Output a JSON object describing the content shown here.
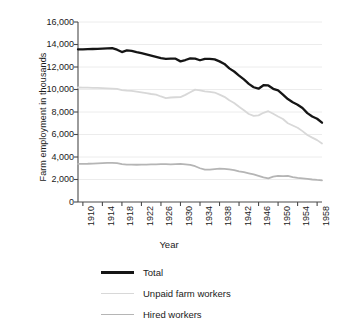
{
  "chart_data": {
    "type": "line",
    "title": "",
    "xlabel": "Year",
    "ylabel": "Farm employment in thousands",
    "xlim": [
      1909,
      1959
    ],
    "ylim": [
      0,
      16000
    ],
    "grid": true,
    "legend_position": "bottom",
    "ytick_labels": [
      "16,000",
      "14,000",
      "12,000",
      "10,000",
      "8,000",
      "6,000",
      "4,000",
      "2,000",
      "0"
    ],
    "ytick_values": [
      16000,
      14000,
      12000,
      10000,
      8000,
      6000,
      4000,
      2000,
      0
    ],
    "xtick_labels": [
      "1910",
      "1914",
      "1918",
      "1922",
      "1926",
      "1930",
      "1934",
      "1938",
      "1942",
      "1946",
      "1950",
      "1954",
      "1958"
    ],
    "xtick_values": [
      1910,
      1914,
      1918,
      1922,
      1926,
      1930,
      1934,
      1938,
      1942,
      1946,
      1950,
      1954,
      1958
    ],
    "x": [
      1909,
      1910,
      1911,
      1912,
      1913,
      1914,
      1915,
      1916,
      1917,
      1918,
      1919,
      1920,
      1921,
      1922,
      1923,
      1924,
      1925,
      1926,
      1927,
      1928,
      1929,
      1930,
      1931,
      1932,
      1933,
      1934,
      1935,
      1936,
      1937,
      1938,
      1939,
      1940,
      1941,
      1942,
      1943,
      1944,
      1945,
      1946,
      1947,
      1948,
      1949,
      1950,
      1951,
      1952,
      1953,
      1954,
      1955,
      1956,
      1957,
      1958,
      1959
    ],
    "series": [
      {
        "name": "Total",
        "color": "#151515",
        "width": 2.3,
        "values": [
          13570,
          13560,
          13580,
          13600,
          13620,
          13640,
          13660,
          13680,
          13540,
          13330,
          13470,
          13430,
          13320,
          13230,
          13120,
          13010,
          12900,
          12790,
          12730,
          12750,
          12740,
          12500,
          12620,
          12760,
          12740,
          12600,
          12730,
          12720,
          12680,
          12500,
          12270,
          11880,
          11600,
          11240,
          10900,
          10500,
          10200,
          10070,
          10380,
          10360,
          10060,
          9930,
          9550,
          9150,
          8860,
          8650,
          8360,
          7900,
          7600,
          7400,
          7050
        ]
      },
      {
        "name": "Unpaid farm workers",
        "color": "#d8d8d8",
        "width": 1.8,
        "values": [
          10180,
          10170,
          10160,
          10150,
          10140,
          10120,
          10100,
          10080,
          10050,
          9950,
          9900,
          9880,
          9820,
          9750,
          9680,
          9600,
          9540,
          9380,
          9240,
          9290,
          9310,
          9320,
          9520,
          9760,
          9990,
          9930,
          9830,
          9780,
          9730,
          9550,
          9350,
          9040,
          8800,
          8460,
          8150,
          7820,
          7660,
          7700,
          7930,
          8070,
          7850,
          7600,
          7380,
          7000,
          6800,
          6600,
          6300,
          5960,
          5720,
          5500,
          5200
        ]
      },
      {
        "name": "Hired workers",
        "color": "#b5b5b5",
        "width": 1.8,
        "values": [
          3380,
          3390,
          3400,
          3420,
          3440,
          3460,
          3480,
          3480,
          3450,
          3370,
          3330,
          3330,
          3310,
          3320,
          3320,
          3340,
          3350,
          3360,
          3360,
          3350,
          3370,
          3380,
          3350,
          3300,
          3180,
          3000,
          2880,
          2870,
          2930,
          2960,
          2950,
          2900,
          2830,
          2720,
          2650,
          2550,
          2450,
          2320,
          2190,
          2100,
          2250,
          2330,
          2300,
          2320,
          2220,
          2150,
          2100,
          2050,
          2000,
          1960,
          1930
        ]
      }
    ]
  },
  "legend": {
    "items": [
      {
        "label": "Total"
      },
      {
        "label": "Unpaid farm workers"
      },
      {
        "label": "Hired workers"
      }
    ]
  },
  "axes": {
    "ylabel": "Farm employment in thousands",
    "xlabel": "Year"
  }
}
